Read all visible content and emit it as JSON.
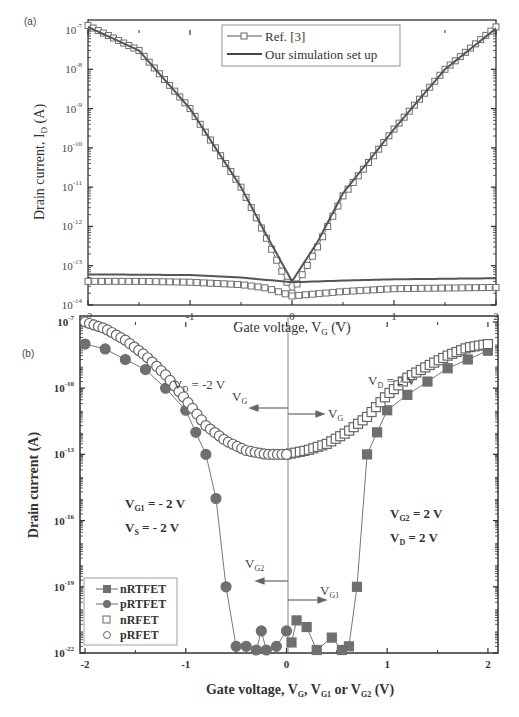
{
  "chart_data": [
    {
      "panel": "(a)",
      "type": "line",
      "title": "",
      "xlabel": "Gate voltage, V_G (V)",
      "ylabel": "Drain current, I_D (A)",
      "xlim": [
        -2,
        2
      ],
      "ylim": [
        1e-14,
        1e-07
      ],
      "yscale": "log",
      "x_ticks": [
        "-2",
        "-1",
        "0",
        "1",
        "2"
      ],
      "y_ticks": [
        "10^-7",
        "10^-8",
        "10^-9",
        "10^-10",
        "10^-11",
        "10^-12",
        "10^-13",
        "10^-14"
      ],
      "grid": false,
      "legend_position": "upper center",
      "legend": [
        "Ref. [3]",
        "Our simulation set up"
      ],
      "series": [
        {
          "name": "Ref. [3] (n-branch)",
          "marker": "open-square",
          "x": [
            -2.0,
            -1.5,
            -1.0,
            -0.5,
            -0.25,
            0.0,
            0.25,
            0.5,
            1.0,
            1.5,
            2.0
          ],
          "y": [
            1.3e-07,
            3e-08,
            1e-09,
            1e-11,
            5e-13,
            2e-14,
            3e-13,
            6e-12,
            3e-10,
            1e-08,
            1.2e-07
          ]
        },
        {
          "name": "Ref. [3] (leakage)",
          "marker": "open-square",
          "x": [
            -2.0,
            -1.5,
            -1.0,
            -0.5,
            -0.25,
            0.0,
            0.5,
            1.0,
            1.5,
            2.0
          ],
          "y": [
            4e-14,
            4e-14,
            3.8e-14,
            3.3e-14,
            2.7e-14,
            1.7e-14,
            2.2e-14,
            2.6e-14,
            2.7e-14,
            2.8e-14
          ]
        },
        {
          "name": "Our simulation set up",
          "marker": "none",
          "x": [
            -2.0,
            -1.5,
            -1.0,
            -0.5,
            -0.25,
            0.0,
            0.25,
            0.5,
            1.0,
            1.5,
            2.0
          ],
          "y": [
            1.2e-07,
            3e-08,
            1e-09,
            1e-11,
            6e-13,
            4e-14,
            4e-13,
            7e-12,
            3e-10,
            1e-08,
            1.1e-07
          ]
        },
        {
          "name": "Our simulation set up (leakage)",
          "marker": "none",
          "x": [
            -2.0,
            -1.0,
            -0.5,
            0.0,
            0.5,
            1.0,
            2.0
          ],
          "y": [
            6e-14,
            5.8e-14,
            5e-14,
            3.8e-14,
            4.2e-14,
            4.5e-14,
            4.8e-14
          ]
        }
      ]
    },
    {
      "panel": "(b)",
      "type": "scatter",
      "title": "",
      "xlabel": "Gate voltage, V_G, V_G1 or V_G2 (V)",
      "ylabel": "Drain current (A)",
      "xlim": [
        -2.05,
        2.1
      ],
      "ylim": [
        1e-22,
        1e-07
      ],
      "yscale": "log",
      "x_ticks": [
        "-2",
        "-1",
        "0",
        "1",
        "2"
      ],
      "y_ticks": [
        "10^-7",
        "10^-10",
        "10^-13",
        "10^-16",
        "10^-19",
        "10^-22"
      ],
      "grid": false,
      "legend_position": "lower left",
      "legend": [
        "nRTFET",
        "pRTFET",
        "nRFET",
        "pRFET"
      ],
      "annotations": [
        "V_D = -2 V",
        "V_D = 2 V",
        "V_G (arrow left)",
        "V_G (arrow right)",
        "V_G1 = - 2 V",
        "V_S = - 2 V",
        "V_G2 = 2 V",
        "V_D = 2 V",
        "V_G2 (arrow left)",
        "V_G1 (arrow right)"
      ],
      "series": [
        {
          "name": "nRTFET",
          "marker": "filled-square",
          "x": [
            0.05,
            0.1,
            0.2,
            0.3,
            0.45,
            0.55,
            0.62,
            0.7,
            0.8,
            0.9,
            1.0,
            1.2,
            1.4,
            1.6,
            1.8,
            2.0
          ],
          "y": [
            3e-22,
            3e-21,
            1.5e-21,
            1e-22,
            5e-22,
            1e-22,
            2e-22,
            1e-19,
            1e-13,
            1e-12,
            1e-11,
            5e-11,
            2e-10,
            8e-10,
            2e-09,
            5e-09
          ]
        },
        {
          "name": "pRTFET",
          "marker": "filled-circle",
          "x": [
            -2.0,
            -1.8,
            -1.6,
            -1.4,
            -1.2,
            -1.0,
            -0.9,
            -0.8,
            -0.7,
            -0.6,
            -0.5,
            -0.4,
            -0.3,
            -0.25,
            -0.2,
            -0.1,
            0.0
          ],
          "y": [
            1e-08,
            6e-09,
            2e-09,
            7e-10,
            1e-10,
            1e-11,
            1e-12,
            1e-13,
            1e-15,
            1e-19,
            2e-22,
            2e-22,
            1e-22,
            1e-21,
            1e-22,
            2e-22,
            1e-21
          ]
        },
        {
          "name": "nRFET",
          "marker": "open-square",
          "x": [
            0.0,
            0.2,
            0.4,
            0.6,
            0.8,
            1.0,
            1.2,
            1.4,
            1.6,
            1.8,
            2.0
          ],
          "y": [
            1e-13,
            1.5e-13,
            3e-13,
            1e-12,
            5e-12,
            5e-11,
            3e-10,
            1e-09,
            3e-09,
            7e-09,
            1e-08
          ]
        },
        {
          "name": "pRFET",
          "marker": "open-circle",
          "x": [
            -2.0,
            -1.8,
            -1.6,
            -1.4,
            -1.2,
            -1.0,
            -0.8,
            -0.6,
            -0.4,
            -0.2,
            0.0
          ],
          "y": [
            1e-07,
            5e-08,
            1.5e-08,
            3e-09,
            4e-10,
            3e-11,
            2e-12,
            4e-13,
            1.5e-13,
            1e-13,
            1e-13
          ]
        }
      ]
    }
  ],
  "panel_a": {
    "label": "(a)",
    "xlabel_main": "Gate voltage, V",
    "xlabel_sub": "G",
    "xlabel_tail": " (V)",
    "ylabel_main": "Drain current, I",
    "ylabel_sub": "D",
    "ylabel_tail": " (A)",
    "x_ticks": [
      "-2",
      "-1",
      "0",
      "1",
      "2"
    ],
    "y_ticks": [
      "-7",
      "-8",
      "-9",
      "-10",
      "-11",
      "-12",
      "-13",
      "-14"
    ],
    "y_base": "10",
    "legend": [
      "Ref. [3]",
      "Our simulation set up"
    ]
  },
  "panel_b": {
    "label": "(b)",
    "xlabel_parts": [
      "Gate voltage, V",
      "G",
      ", V",
      "G1",
      " or V",
      "G2",
      " (V)"
    ],
    "ylabel": "Drain current (A)",
    "x_ticks": [
      "-2",
      "-1",
      "0",
      "1",
      "2"
    ],
    "y_ticks": [
      "-7",
      "-10",
      "-13",
      "-16",
      "-19",
      "-22"
    ],
    "y_base": "10",
    "legend": [
      "nRTFET",
      "pRTFET",
      "nRFET",
      "pRFET"
    ],
    "annot": {
      "vd_left": [
        "V",
        "D",
        " = -2 V"
      ],
      "vd_right": [
        "V",
        "D",
        " = 2 V"
      ],
      "vg": [
        "V",
        "G"
      ],
      "vg1_left": [
        "V",
        "G1",
        " = - 2 V"
      ],
      "vs_left": [
        "V",
        "S",
        " = - 2 V"
      ],
      "vg2_right": [
        "V",
        "G2",
        " = 2 V"
      ],
      "vd2_right": [
        "V",
        "D",
        " = 2 V"
      ],
      "vg2": [
        "V",
        "G2"
      ],
      "vg1": [
        "V",
        "G1"
      ]
    }
  },
  "colors": {
    "marker": "#6f6f6f",
    "line": "#555555",
    "axis": "#333333"
  }
}
